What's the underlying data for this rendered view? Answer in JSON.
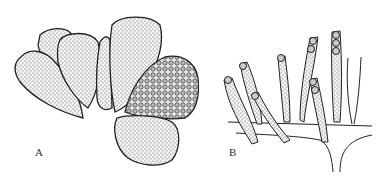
{
  "figure": {
    "panels": [
      {
        "id": "A",
        "label": "A",
        "description": "Cluster of seven pear-shaped sporangia, stippled; one filled with spores"
      },
      {
        "id": "B",
        "label": "B",
        "description": "Elongated sporangia arising from branching hyphae, some with spores at tips"
      }
    ],
    "colors": {
      "ink": "#222222",
      "background": "#ffffff",
      "stipple": "#555555"
    }
  }
}
